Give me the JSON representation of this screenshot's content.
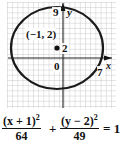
{
  "graph": {
    "center_label": "(−1, 2)",
    "center_y_tick": "2",
    "origin_label": "0",
    "y_top_label": "9",
    "x_right_label": "7",
    "x_axis_label": "x",
    "y_axis_label": "y",
    "colors": {
      "grid": "#b5b5b5",
      "axis": "#222222",
      "ellipse": "#1a1a1a",
      "point": "#111111"
    }
  },
  "equation": {
    "term1_numerator": "(x + 1)",
    "term1_exponent": "2",
    "term1_denominator": "64",
    "plus": "+",
    "term2_numerator": "(y − 2)",
    "term2_exponent": "2",
    "term2_denominator": "49",
    "equals": "= 1"
  }
}
